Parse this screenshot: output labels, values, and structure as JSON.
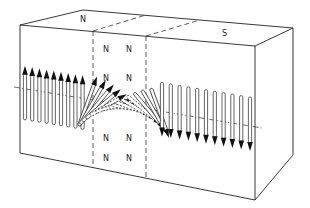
{
  "diagram": {
    "type": "domain wall (Bloch wall) magnetization rotation in a block",
    "labels": {
      "top_left": "N",
      "top_right": "S",
      "wall_face": [
        "N",
        "N",
        "N",
        "N",
        "N",
        "N",
        "N",
        "N"
      ]
    },
    "regions": [
      {
        "name": "left-domain",
        "pole": "N",
        "arrow_direction": "up"
      },
      {
        "name": "domain-wall",
        "description": "spins rotate through plane between dashed lines"
      },
      {
        "name": "right-domain",
        "pole": "S",
        "arrow_direction": "down"
      }
    ],
    "colors": {
      "line": "#222222",
      "arrow_fill": "#111111",
      "background": "#ffffff"
    }
  }
}
